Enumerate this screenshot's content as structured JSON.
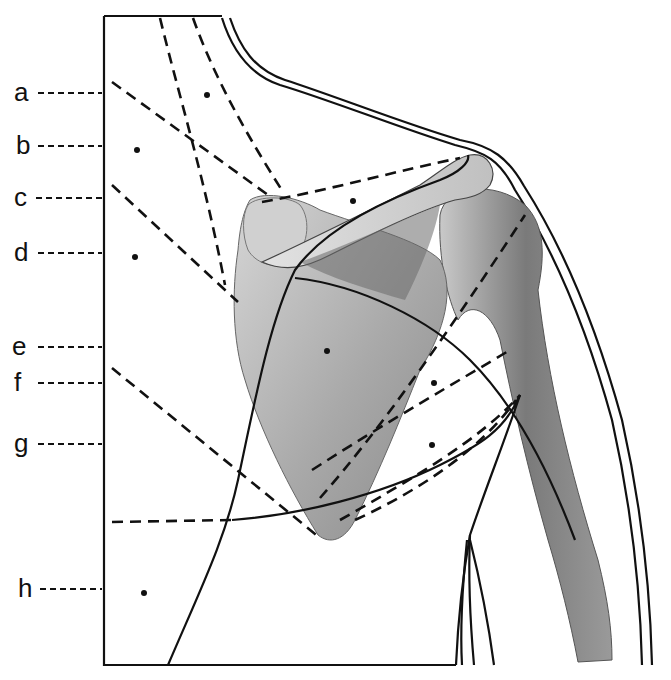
{
  "figure": {
    "labels": [
      {
        "letter": "a",
        "y": 93
      },
      {
        "letter": "b",
        "y": 146
      },
      {
        "letter": "c",
        "y": 198
      },
      {
        "letter": "d",
        "y": 253
      },
      {
        "letter": "e",
        "y": 347
      },
      {
        "letter": "f",
        "y": 383
      },
      {
        "letter": "g",
        "y": 444
      },
      {
        "letter": "h",
        "y": 589
      }
    ],
    "colors": {
      "line": "#111111",
      "bone_light": "#d9d9d9",
      "bone_mid": "#a8a8a8",
      "bone_dark": "#6e6e6e",
      "background": "#ffffff"
    }
  }
}
